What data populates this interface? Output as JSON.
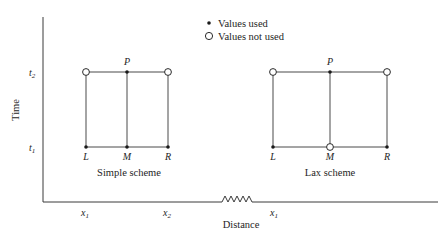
{
  "legend": {
    "used_label": "Values used",
    "not_used_label": "Values not used",
    "used_icon": "filled-dot",
    "not_used_icon": "hollow-circle"
  },
  "axes": {
    "y_label": "Time",
    "x_label": "Distance",
    "y_ticks": {
      "t2": "t",
      "t2_sub": "2",
      "t1": "t",
      "t1_sub": "1"
    },
    "x_ticks": [
      {
        "main": "x",
        "sub": "1"
      },
      {
        "main": "x",
        "sub": "2"
      },
      {
        "main": "x",
        "sub": "1"
      }
    ],
    "axis_break": "zigzag"
  },
  "schemes": [
    {
      "name": "Simple scheme",
      "points": {
        "P": {
          "label": "P",
          "status": "used"
        },
        "L": {
          "label": "L",
          "status": "used"
        },
        "M": {
          "label": "M",
          "status": "used"
        },
        "R": {
          "label": "R",
          "status": "used"
        },
        "TL": {
          "status": "not used"
        },
        "TR": {
          "status": "not used"
        }
      }
    },
    {
      "name": "Lax scheme",
      "points": {
        "P": {
          "label": "P",
          "status": "used"
        },
        "L": {
          "label": "L",
          "status": "used"
        },
        "M": {
          "label": "M",
          "status": "not used"
        },
        "R": {
          "label": "R",
          "status": "used"
        },
        "TL": {
          "status": "not used"
        },
        "TR": {
          "status": "not used"
        }
      }
    }
  ]
}
